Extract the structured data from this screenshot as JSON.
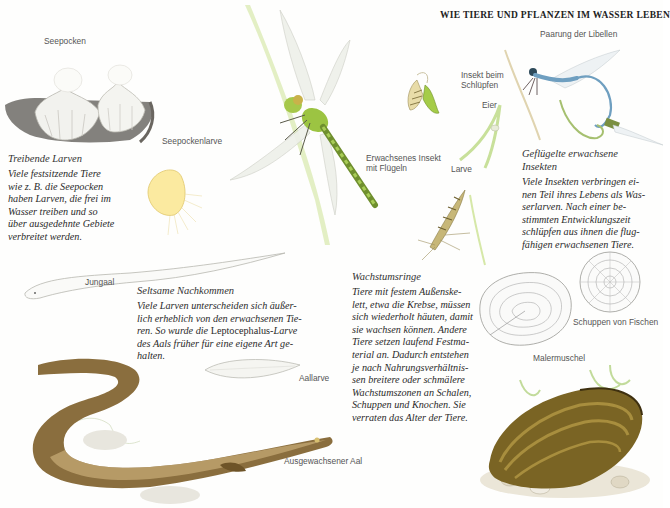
{
  "header": {
    "title": "WIE TIERE UND PFLANZEN IM WASSER LEBEN"
  },
  "labels": {
    "seepocken": "Seepocken",
    "seepockenlarve": "Seepockenlarve",
    "erwachsenes_insekt_1": "Erwachsenes Insekt",
    "erwachsenes_insekt_2": "mit Flügeln",
    "insekt_schluepfen_1": "Insekt beim",
    "insekt_schluepfen_2": "Schlüpfen",
    "eier": "Eier",
    "larve": "Larve",
    "paarung": "Paarung der Libellen",
    "jungaal": "Jungaal",
    "aallarve": "Aallarve",
    "ausgewachsener_aal": "Ausgewachsener Aal",
    "schuppen": "Schuppen von Fischen",
    "malermuschel": "Malermuschel"
  },
  "blocks": {
    "treibende": {
      "title": "Treibende Larven",
      "lines": [
        "Viele festsitzende Tiere",
        "wie z. B. die Seepocken",
        "haben Larven, die frei im",
        "Wasser treiben und so",
        "über ausgedehnte Gebiete",
        "verbreitet werden."
      ]
    },
    "gefluegelte": {
      "title_1": "Geflügelte erwachsene",
      "title_2": "Insekten",
      "lines": [
        "Viele Insekten verbringen ei-",
        "nen Teil ihres Lebens als Was-",
        "serlarven. Nach einer be-",
        "stimmten Entwicklungszeit",
        "schlüpfen aus ihnen die flug-",
        "fähigen erwachsenen Tiere."
      ]
    },
    "seltsame": {
      "title": "Seltsame Nachkommen",
      "lines": [
        "Viele Larven unterscheiden sich äußer-",
        "lich erheblich von den erwachsenen Tie-"
      ],
      "line3_a": "ren. So wurde die ",
      "line3_b": "Leptocephalus",
      "line3_c": "-Larve",
      "lines_end": [
        "des Aals früher für eine eigene Art ge-",
        "halten."
      ]
    },
    "wachstum": {
      "title": "Wachstumsringe",
      "lines": [
        "Tiere mit festem Außenske-",
        "lett, etwa die Krebse, müssen",
        "sich wiederholt häuten, damit",
        "sie wachsen können. Andere",
        "Tiere setzen laufend Festma-",
        "terial an. Dadurch entstehen",
        "je nach Nahrungsverhältnis-",
        "sen breitere oder schmälere",
        "Wachstumszonen an Schalen,",
        "Schuppen und Knochen. Sie",
        "verraten das Alter der Tiere."
      ]
    }
  },
  "colors": {
    "text": "#2a2a2a",
    "label": "#555555",
    "dragonfly_green": "#8fbf3a",
    "damselfly_blue": "#6f9fc0",
    "eel_brown": "#7a6238",
    "mussel_brown": "#6b5420",
    "grass": "#c8e09a"
  }
}
